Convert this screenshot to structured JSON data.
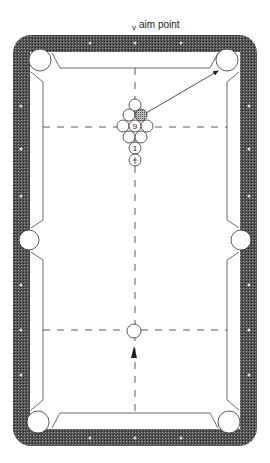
{
  "labels": {
    "aim_caret": "v",
    "aim_point": "aim point"
  },
  "balls": {
    "nine": "9",
    "one": "1"
  },
  "colors": {
    "rail": "#3a3a3a",
    "felt": "#ffffff",
    "line": "#333333",
    "diamond": "#d8d8d8"
  }
}
